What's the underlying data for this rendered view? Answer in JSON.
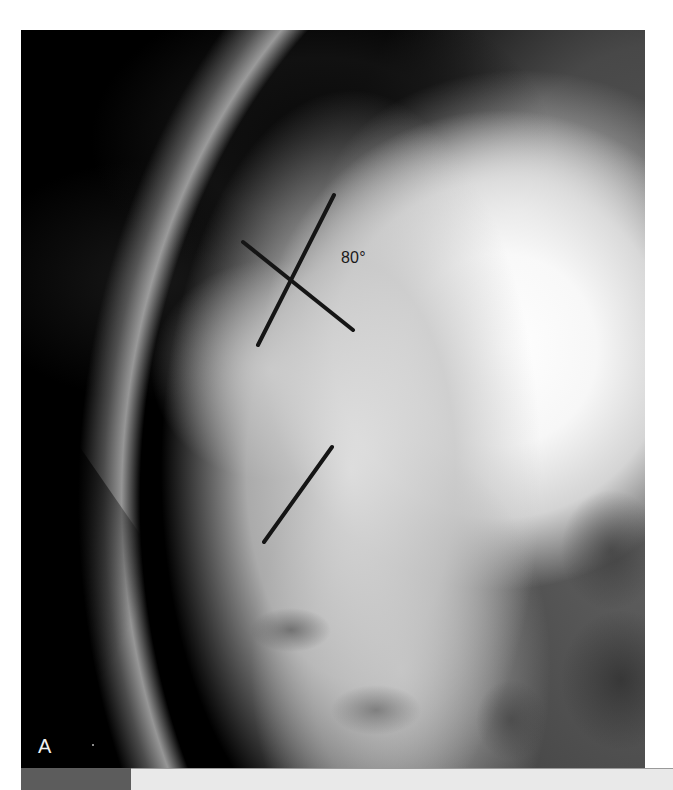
{
  "figure": {
    "type": "lateral spine radiograph",
    "panel_label": "A",
    "annotations": {
      "angle_label": "80°",
      "lines": [
        {
          "name": "upper-endplate-line",
          "x1": 334,
          "y1": 195,
          "x2": 258,
          "y2": 345
        },
        {
          "name": "perpendicular-line",
          "x1": 243,
          "y1": 242,
          "x2": 353,
          "y2": 330
        },
        {
          "name": "lower-endplate-line",
          "x1": 332,
          "y1": 447,
          "x2": 264,
          "y2": 542
        }
      ],
      "line_color": "#151515"
    }
  },
  "footer": {
    "block_color": "#5c5c5c",
    "bar_color": "#e9e9e9"
  }
}
